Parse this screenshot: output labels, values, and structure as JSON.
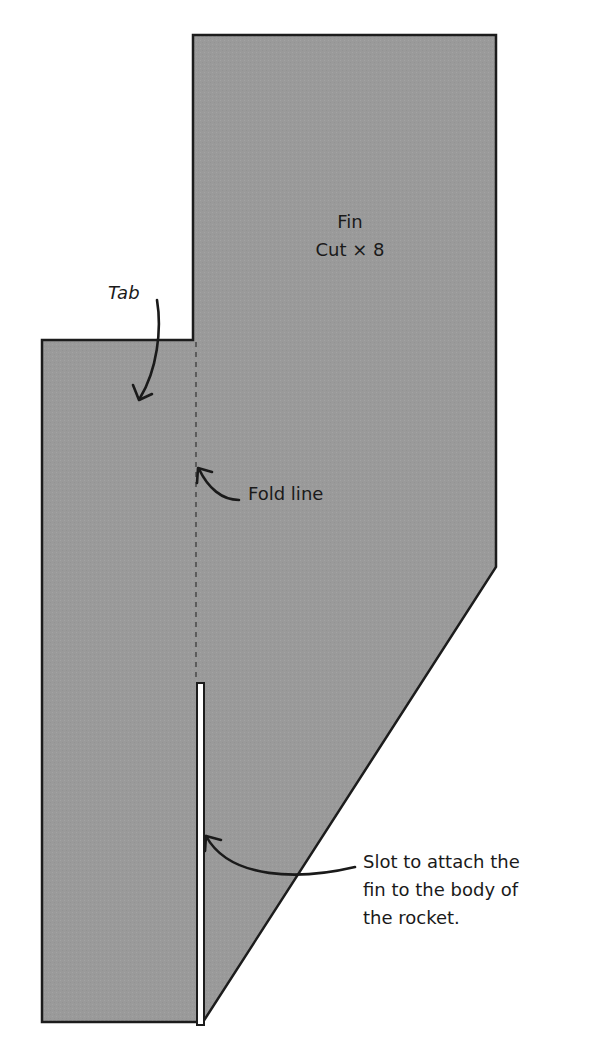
{
  "diagram": {
    "type": "paper-template",
    "piece_name": "Fin",
    "instruction": "Cut x 8",
    "colors": {
      "fill": "#9a9a9a",
      "outline": "#1c1c1c",
      "background": "#ffffff",
      "slot": "#ffffff"
    }
  },
  "labels": {
    "title": "Fin",
    "cut": "Cut × 8",
    "tab": "Tab",
    "fold_line": "Fold line",
    "slot_line1": "Slot to attach the",
    "slot_line2": "fin to the body of",
    "slot_line3": "the rocket."
  }
}
